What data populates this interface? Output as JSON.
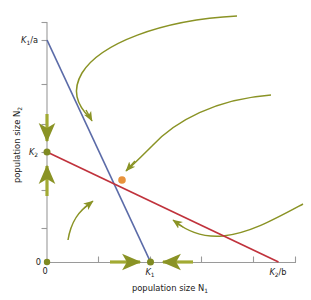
{
  "figure": {
    "type": "diagram",
    "colors": {
      "isocline_species1": "#5b6ba8",
      "isocline_species2": "#c0323c",
      "trajectory": "#8a9325",
      "equilibrium_point": "#e8923c",
      "endpoint_dot": "#7f8a22",
      "axis": "#9a9a9a",
      "text": "#1a1a1a",
      "background": "#ffffff"
    }
  },
  "axes": {
    "x": {
      "title_prefix": "population size ",
      "title_var": "N",
      "title_sub": "1",
      "range_px": [
        47,
        295
      ],
      "tick_labels": [
        {
          "text": "0",
          "value_px": 47
        },
        {
          "text": "K₁",
          "value_px": 150
        },
        {
          "text": "K₂/b",
          "value_px": 278
        }
      ],
      "tick_positions_px": [
        47,
        98,
        150,
        175,
        201,
        253,
        295
      ]
    },
    "y": {
      "title_prefix": "population size ",
      "title_var": "N",
      "title_sub": "2",
      "range_px": [
        22,
        262
      ],
      "tick_labels": [
        {
          "text": "K₁/a",
          "value_px": 40
        },
        {
          "text": "K₂",
          "value_px": 152
        },
        {
          "text": "0",
          "value_px": 262
        }
      ],
      "tick_positions_px": [
        22,
        40,
        84,
        124,
        152,
        190,
        228,
        262
      ]
    }
  },
  "labels": {
    "y_top": {
      "base": "K",
      "sub": "1",
      "suffix": "/a"
    },
    "y_k2": {
      "base": "K",
      "sub": "2",
      "suffix": ""
    },
    "y_zero": "0",
    "x_zero": "0",
    "x_k1": {
      "base": "K",
      "sub": "1",
      "suffix": ""
    },
    "x_k2b": {
      "base": "K",
      "sub": "2",
      "suffix": "/b"
    },
    "x_axis_title": "population size",
    "x_axis_var": "N",
    "x_axis_sub": "1",
    "y_axis_title": "population size",
    "y_axis_var": "N",
    "y_axis_sub": "2"
  },
  "isoclines": [
    {
      "name": "species-1-isocline",
      "color": "#5b6ba8",
      "from_px": [
        47,
        40
      ],
      "to_px": [
        150,
        262
      ],
      "from_label": "K₁/a",
      "to_label": "K₁"
    },
    {
      "name": "species-2-isocline",
      "color": "#c0323c",
      "from_px": [
        47,
        152
      ],
      "to_px": [
        278,
        262
      ],
      "from_label": "K₂",
      "to_label": "K₂/b"
    }
  ],
  "points": [
    {
      "name": "origin-point",
      "px": [
        47,
        262
      ],
      "color": "#7f8a22",
      "r": 3.2
    },
    {
      "name": "k2-intercept-point",
      "px": [
        47,
        152
      ],
      "color": "#7f8a22",
      "r": 3.4
    },
    {
      "name": "k1-intercept-point",
      "px": [
        150,
        262
      ],
      "color": "#7f8a22",
      "r": 3.4
    },
    {
      "name": "unstable-equilibrium-point",
      "px": [
        122,
        180
      ],
      "color": "#e8923c",
      "r": 3.8
    }
  ],
  "trajectories": [
    {
      "name": "upper-left-trajectory-arrow",
      "direction": "down-left"
    },
    {
      "name": "upper-right-trajectory-arrow",
      "direction": "down-left"
    },
    {
      "name": "lower-left-trajectory-arrow",
      "direction": "up-right"
    },
    {
      "name": "lower-right-trajectory-arrow",
      "direction": "up-left"
    },
    {
      "name": "y-axis-down-arrow",
      "direction": "down"
    },
    {
      "name": "y-axis-up-arrow",
      "direction": "up"
    },
    {
      "name": "x-axis-right-arrow",
      "direction": "right"
    },
    {
      "name": "x-axis-left-arrow",
      "direction": "left"
    }
  ]
}
